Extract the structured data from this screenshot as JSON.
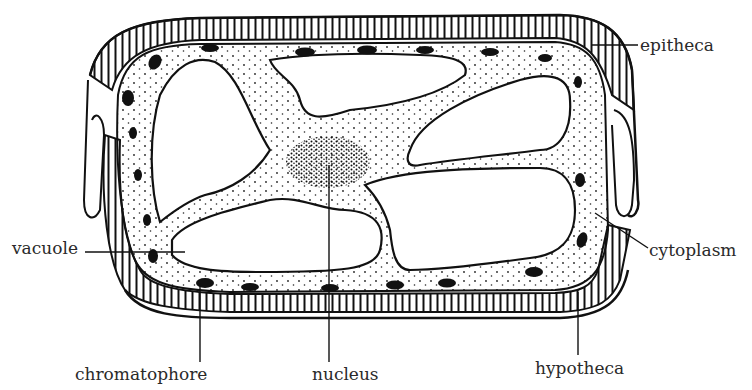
{
  "figure": {
    "colors": {
      "ink": "#111111",
      "background": "#ffffff",
      "label_text": "#2a2a2a"
    }
  },
  "labels": {
    "epitheca": "epitheca",
    "cytoplasm": "cytoplasm",
    "vacuole": "vacuole",
    "chromatophore": "chromatophore",
    "nucleus": "nucleus",
    "hypotheca": "hypotheca"
  }
}
